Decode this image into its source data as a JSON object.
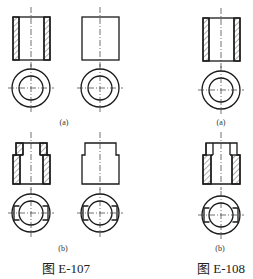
{
  "figures": [
    {
      "caption": "图 E-107",
      "views": [
        {
          "label": "(a)",
          "description": "Two variants: sectioned hollow cylinder (left) and unsectioned cylinder (right), each with top view of concentric circles"
        },
        {
          "label": "(b)",
          "description": "Two variants: sectioned stepped hollow cylinder (left) and unsectioned stepped cylinder (right), each with top view showing concentric circles with flats"
        }
      ]
    },
    {
      "caption": "图 E-108",
      "views": [
        {
          "label": "(a)",
          "description": "Sectioned hollow cylinder with top view of concentric circles"
        },
        {
          "label": "(b)",
          "description": "Sectioned stepped hollow cylinder with top view showing concentric circles with flats"
        }
      ]
    }
  ],
  "colors": {
    "line": "#1a1a1a",
    "background": "#ffffff"
  }
}
